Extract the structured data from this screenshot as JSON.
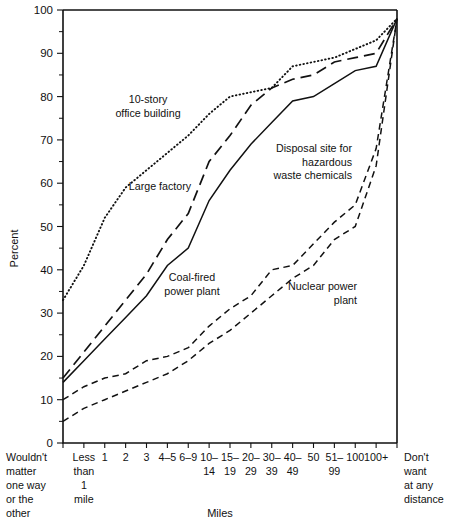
{
  "chart_data": {
    "type": "line",
    "title": "",
    "xlabel": "Miles",
    "ylabel": "Percent",
    "ylim": [
      0,
      100
    ],
    "yticks": [
      0,
      10,
      20,
      30,
      40,
      50,
      60,
      70,
      80,
      90,
      100
    ],
    "grid": false,
    "legend": "inline-annotations",
    "categories": [
      "Wouldn't matter one way or the other",
      "Less than 1 mile",
      "1",
      "2",
      "3",
      "4–5",
      "6–9",
      "10–14",
      "15–19",
      "20–29",
      "30–39",
      "40–49",
      "50",
      "51–99",
      "100",
      "100+",
      "Don't want at any distance"
    ],
    "category_labels": [
      {
        "line1": "Wouldn't",
        "line2": "matter",
        "line3": "one way",
        "line4": "or the",
        "line5": "other"
      },
      {
        "line1": "Less",
        "line2": "than",
        "line3": "1",
        "line4": "mile"
      },
      {
        "line1": "1"
      },
      {
        "line1": "2"
      },
      {
        "line1": "3"
      },
      {
        "line1": "4–5"
      },
      {
        "line1": "6–9"
      },
      {
        "line1": "10–",
        "line2": "14"
      },
      {
        "line1": "15–",
        "line2": "19"
      },
      {
        "line1": "20–",
        "line2": "29"
      },
      {
        "line1": "30–",
        "line2": "39"
      },
      {
        "line1": "40–",
        "line2": "49"
      },
      {
        "line1": "50"
      },
      {
        "line1": "51–",
        "line2": "99"
      },
      {
        "line1": "100"
      },
      {
        "line1": "100+"
      },
      {
        "line1": "Don't",
        "line2": "want",
        "line3": "at any",
        "line4": "distance"
      }
    ],
    "series": [
      {
        "name": "10-story office building",
        "style": "dotted",
        "label_lines": [
          "10-story",
          "office building"
        ],
        "values": [
          33,
          41,
          52,
          59,
          63,
          67,
          71,
          76,
          80,
          81,
          82,
          87,
          88,
          89,
          91,
          93,
          98
        ]
      },
      {
        "name": "Large factory",
        "style": "long-dash",
        "label_lines": [
          "Large factory"
        ],
        "values": [
          15,
          21,
          27,
          33,
          39,
          47,
          53,
          65,
          71,
          78,
          82,
          84,
          85,
          88,
          89,
          90,
          98
        ]
      },
      {
        "name": "Coal-fired power plant",
        "style": "solid",
        "label_lines": [
          "Coal-fired",
          "power plant"
        ],
        "values": [
          14,
          19,
          24,
          29,
          34,
          41,
          45,
          56,
          63,
          69,
          74,
          79,
          80,
          83,
          86,
          87,
          98
        ]
      },
      {
        "name": "Disposal site for hazardous waste chemicals",
        "style": "short-dash",
        "label_lines": [
          "Disposal site for",
          "hazardous",
          "waste chemicals"
        ],
        "values": [
          10,
          13,
          15,
          16,
          19,
          20,
          22,
          27,
          31,
          34,
          40,
          41,
          46,
          51,
          55,
          68,
          98
        ]
      },
      {
        "name": "Nuclear power plant",
        "style": "short-dash-2",
        "label_lines": [
          "Nuclear power",
          "plant"
        ],
        "values": [
          5,
          8,
          10,
          12,
          14,
          16,
          19,
          23,
          26,
          30,
          34,
          38,
          41,
          47,
          50,
          64,
          98
        ]
      }
    ],
    "annotations": [
      {
        "text": "10-story office building",
        "x": 148,
        "y": 103
      },
      {
        "text": "Large factory",
        "x": 160,
        "y": 190
      },
      {
        "text": "Coal-fired power plant",
        "x": 192,
        "y": 281
      },
      {
        "text": "Disposal site for hazardous waste chemicals",
        "x": 352,
        "y": 152
      },
      {
        "text": "Nuclear power plant",
        "x": 357,
        "y": 290
      }
    ]
  },
  "axes": {
    "y_title": "Percent",
    "x_title": "Miles"
  }
}
